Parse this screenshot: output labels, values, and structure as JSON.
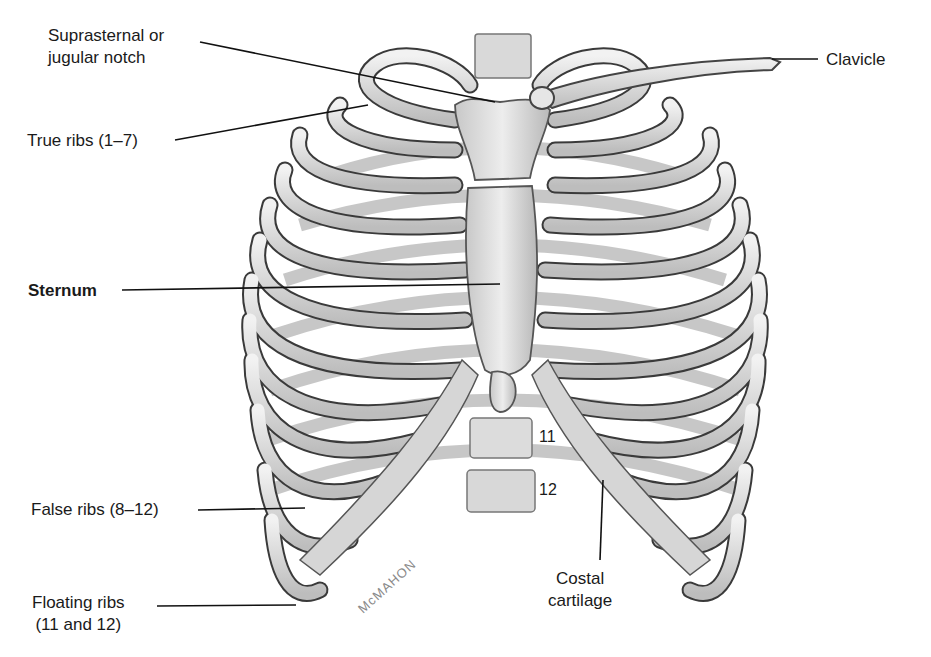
{
  "figure": {
    "labels": {
      "suprasternal": {
        "line1": "Suprasternal or",
        "line2": "jugular notch"
      },
      "true_ribs": "True ribs (1–7)",
      "sternum": "Sternum",
      "false_ribs": "False ribs (8–12)",
      "floating_ribs": {
        "line1": "Floating ribs",
        "line2": "(11 and 12)"
      },
      "clavicle": "Clavicle",
      "costal_cartilage": {
        "line1": "Costal",
        "line2": "cartilage"
      }
    },
    "vertebra_numbers": {
      "t11": "11",
      "t12": "12"
    },
    "artist_signature": "McMAHON",
    "colors": {
      "bone": "#e6e6e6",
      "bone_shadow": "#a8a8a8",
      "outline": "#3a3a3a",
      "cartilage": "#d4d4d4",
      "leader_line": "#111111"
    }
  }
}
